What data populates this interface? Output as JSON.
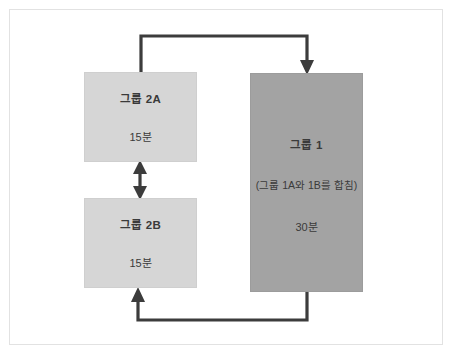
{
  "diagram": {
    "title_present": false,
    "colors": {
      "frame_border": "#e2e2e2",
      "box_light": "#d6d6d6",
      "box_dark": "#a3a3a3",
      "connector": "#3c3c3c",
      "text": "#3a3a3a",
      "background": "#ffffff"
    },
    "nodes": [
      {
        "id": "group-2a",
        "title": "그룹 2A",
        "duration": "15분",
        "note": "",
        "fill": "light"
      },
      {
        "id": "group-2b",
        "title": "그룹 2B",
        "duration": "15분",
        "note": "",
        "fill": "light"
      },
      {
        "id": "group-1",
        "title": "그룹 1",
        "note": "(그룹 1A와 1B를 합침)",
        "duration": "30분",
        "fill": "dark"
      }
    ],
    "connectors": [
      {
        "id": "connector-2a-to-group1",
        "from": "group-2a",
        "to": "group-1",
        "direction": "one-way",
        "route": "top"
      },
      {
        "id": "connector-group1-to-2b",
        "from": "group-1",
        "to": "group-2b",
        "direction": "one-way",
        "route": "bottom"
      },
      {
        "id": "connector-2a-2b",
        "from": "group-2a",
        "to": "group-2b",
        "direction": "two-way",
        "route": "vertical"
      }
    ]
  }
}
